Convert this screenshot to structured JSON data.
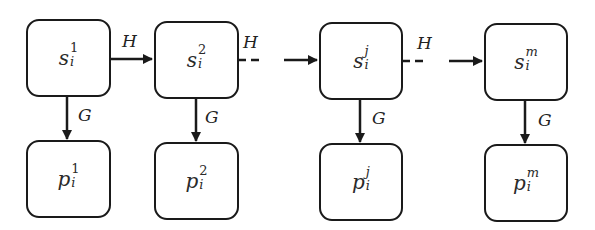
{
  "diagram": {
    "state_nodes": [
      {
        "base": "s",
        "sub": "i",
        "sup": "1"
      },
      {
        "base": "s",
        "sub": "i",
        "sup": "2"
      },
      {
        "base": "s",
        "sub": "i",
        "sup": "j"
      },
      {
        "base": "s",
        "sub": "i",
        "sup": "m"
      }
    ],
    "output_nodes": [
      {
        "base": "p",
        "sub": "i",
        "sup": "1"
      },
      {
        "base": "p",
        "sub": "i",
        "sup": "2"
      },
      {
        "base": "p",
        "sub": "i",
        "sup": "j"
      },
      {
        "base": "p",
        "sub": "i",
        "sup": "m"
      }
    ],
    "horizontal_edges": [
      {
        "label": "H",
        "style": "solid",
        "from": "s_i^1",
        "to": "s_i^2"
      },
      {
        "label": "H",
        "style": "dashed",
        "from": "s_i^2",
        "to": "s_i^j"
      },
      {
        "label": "H",
        "style": "dashed",
        "from": "s_i^j",
        "to": "s_i^m"
      }
    ],
    "vertical_edges": [
      {
        "label": "G",
        "from": "s_i^1",
        "to": "p_i^1"
      },
      {
        "label": "G",
        "from": "s_i^2",
        "to": "p_i^2"
      },
      {
        "label": "G",
        "from": "s_i^j",
        "to": "p_i^j"
      },
      {
        "label": "G",
        "from": "s_i^m",
        "to": "p_i^m"
      }
    ],
    "colors": {
      "stroke": "#1a1a1a",
      "background": "#ffffff"
    }
  }
}
